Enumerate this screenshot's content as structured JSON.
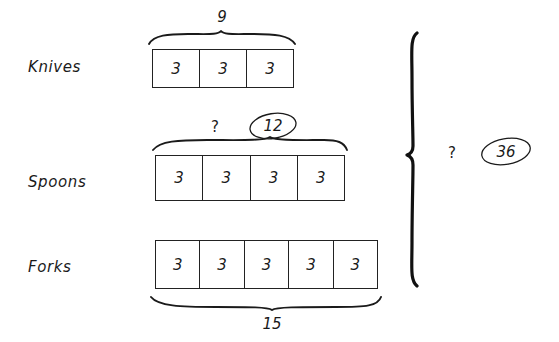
{
  "diagram": {
    "type": "tape-diagram",
    "background_color": "#ffffff",
    "ink_color": "#1a1a1a",
    "rows": [
      {
        "label": "Knives",
        "cells": [
          "3",
          "3",
          "3"
        ],
        "unit_value": 3,
        "count": 3,
        "brace_position": "top",
        "total_label": "9",
        "total_value": 9,
        "total_circled": false
      },
      {
        "label": "Spoons",
        "cells": [
          "3",
          "3",
          "3",
          "3"
        ],
        "unit_value": 3,
        "count": 4,
        "brace_position": "top",
        "unknown_label": "?",
        "total_label": "12",
        "total_value": 12,
        "total_circled": true
      },
      {
        "label": "Forks",
        "cells": [
          "3",
          "3",
          "3",
          "3",
          "3"
        ],
        "unit_value": 3,
        "count": 5,
        "brace_position": "bottom",
        "total_label": "15",
        "total_value": 15,
        "total_circled": false
      }
    ],
    "grand_total": {
      "unknown_label": "?",
      "value_label": "36",
      "value": 36,
      "circled": true,
      "brace_orientation": "vertical-right"
    }
  }
}
